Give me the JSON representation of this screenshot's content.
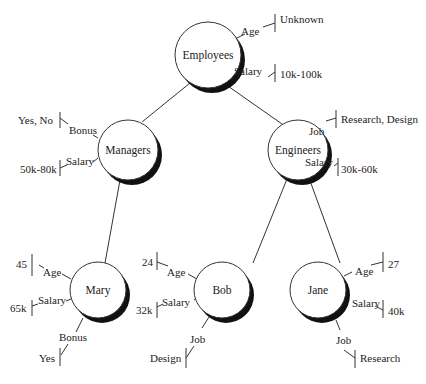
{
  "nodes": {
    "employees": {
      "label": "Employees",
      "attrs": [
        {
          "name": "Age",
          "value": "Unknown"
        },
        {
          "name": "Salary",
          "value": "10k-100k"
        }
      ]
    },
    "managers": {
      "label": "Managers",
      "attrs": [
        {
          "name": "Bonus",
          "value": "Yes, No"
        },
        {
          "name": "Salary",
          "value": "50k-80k"
        }
      ]
    },
    "engineers": {
      "label": "Engineers",
      "attrs": [
        {
          "name": "Job",
          "value": "Research, Design"
        },
        {
          "name": "Salary",
          "value": "30k-60k"
        }
      ]
    },
    "mary": {
      "label": "Mary",
      "attrs": [
        {
          "name": "Age",
          "value": "45"
        },
        {
          "name": "Salary",
          "value": "65k"
        },
        {
          "name": "Bonus",
          "value": "Yes"
        }
      ]
    },
    "bob": {
      "label": "Bob",
      "attrs": [
        {
          "name": "Age",
          "value": "24"
        },
        {
          "name": "Salary",
          "value": "32k"
        },
        {
          "name": "Job",
          "value": "Design"
        }
      ]
    },
    "jane": {
      "label": "Jane",
      "attrs": [
        {
          "name": "Age",
          "value": "27"
        },
        {
          "name": "Salary",
          "value": "40k"
        },
        {
          "name": "Job",
          "value": "Research"
        }
      ]
    }
  },
  "edges": [
    [
      "employees",
      "managers"
    ],
    [
      "employees",
      "engineers"
    ],
    [
      "managers",
      "mary"
    ],
    [
      "engineers",
      "bob"
    ],
    [
      "engineers",
      "jane"
    ]
  ]
}
